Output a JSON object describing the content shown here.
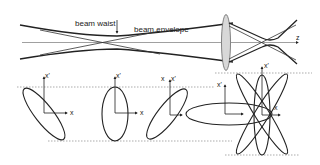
{
  "beam_diagram": {
    "labels": {
      "beam_waist": "beam waist",
      "beam_envelope": "beam envelope",
      "z_axis": "z"
    }
  },
  "phase_space": {
    "axis_labels": {
      "x": "x",
      "x_prime": "x'"
    },
    "panels": [
      {
        "id": "diverging-before-waist",
        "x_label": "x",
        "xp_label": "x'"
      },
      {
        "id": "at-waist",
        "x_label": "x",
        "xp_label": "x'"
      },
      {
        "id": "converging",
        "x_label": "x",
        "xp_label": "x'"
      },
      {
        "id": "lens-transform",
        "x_label": "x",
        "xp_label": "x'"
      }
    ],
    "colors": {
      "line": "#222222",
      "dashed_guide": "#888888",
      "lens_fill": "#d8d8d8"
    }
  }
}
